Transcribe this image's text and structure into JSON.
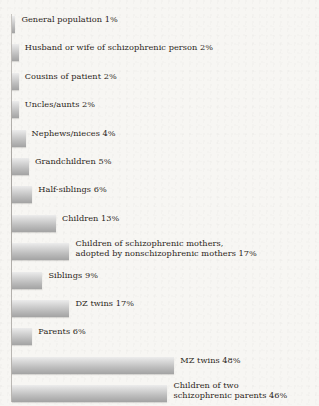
{
  "figure": {
    "title_fragment": "",
    "paper_color": "#f7f6f3",
    "bar_color_top": "#ececec",
    "bar_color_bottom": "#a3a3a3",
    "text_color": "#2b2520"
  },
  "chart_data": {
    "type": "bar",
    "orientation": "horizontal",
    "title": "",
    "xlabel": "",
    "ylabel": "",
    "xlim": [
      0,
      50
    ],
    "grid": false,
    "legend": null,
    "unit": "%",
    "categories": [
      "General population",
      "Husband or wife of schizophrenic person",
      "Cousins of patient",
      "Uncles/aunts",
      "Nephews/nieces",
      "Grandchildren",
      "Half-siblings",
      "Children",
      "Children of schizophrenic mothers, adopted by nonschizophrenic mothers",
      "Siblings",
      "DZ twins",
      "Parents",
      "MZ twins",
      "Children of two schizophrenic parents"
    ],
    "values": [
      1,
      2,
      2,
      2,
      4,
      5,
      6,
      13,
      17,
      9,
      17,
      6,
      48,
      46
    ],
    "bars": [
      {
        "label": "General population 1%",
        "value": 1,
        "lines": [
          "General population 1%"
        ]
      },
      {
        "label": "Husband or wife of schizophrenic person 2%",
        "value": 2,
        "lines": [
          "Husband or wife of schizophrenic person 2%"
        ]
      },
      {
        "label": "Cousins of patient 2%",
        "value": 2,
        "lines": [
          "Cousins of patient 2%"
        ]
      },
      {
        "label": "Uncles/aunts 2%",
        "value": 2,
        "lines": [
          "Uncles/aunts 2%"
        ]
      },
      {
        "label": "Nephews/nieces 4%",
        "value": 4,
        "lines": [
          "Nephews/nieces 4%"
        ]
      },
      {
        "label": "Grandchildren 5%",
        "value": 5,
        "lines": [
          "Grandchildren 5%"
        ]
      },
      {
        "label": "Half-siblings 6%",
        "value": 6,
        "lines": [
          "Half-siblings 6%"
        ]
      },
      {
        "label": "Children 13%",
        "value": 13,
        "lines": [
          "Children 13%"
        ]
      },
      {
        "label": "Children of schizophrenic mothers, adopted by nonschizophrenic mothers 17%",
        "value": 17,
        "lines": [
          "Children of schizophrenic mothers,",
          "adopted by nonschizophrenic mothers 17%"
        ]
      },
      {
        "label": "Siblings 9%",
        "value": 9,
        "lines": [
          "Siblings 9%"
        ]
      },
      {
        "label": "DZ twins 17%",
        "value": 17,
        "lines": [
          "DZ twins 17%"
        ]
      },
      {
        "label": "Parents 6%",
        "value": 6,
        "lines": [
          "Parents 6%"
        ]
      },
      {
        "label": "MZ twins 48%",
        "value": 48,
        "lines": [
          "MZ twins 48%"
        ]
      },
      {
        "label": "Children of two schizophrenic parents 46%",
        "value": 46,
        "lines": [
          "Children of two",
          "schizophrenic parents 46%"
        ]
      }
    ]
  },
  "layout": {
    "bar_origin_x": 12,
    "px_per_percent": 3.38,
    "first_bar_top": 16,
    "row_pitch": 28.4,
    "bar_height": 17,
    "label_gap": 6
  }
}
